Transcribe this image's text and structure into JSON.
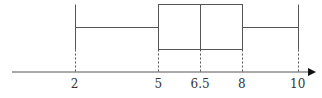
{
  "chart_data": {
    "type": "boxplot",
    "title": "",
    "xlabel": "",
    "ylabel": "",
    "min": 2,
    "q1": 5,
    "median": 6.5,
    "q3": 8,
    "max": 10,
    "tick_labels": [
      "2",
      "5",
      "6.5",
      "8",
      "10"
    ],
    "tick_values": [
      2,
      5,
      6.5,
      8,
      10
    ],
    "orientation": "horizontal",
    "grid": false,
    "axis_arrow": true
  },
  "style": {
    "line_color": "#555555",
    "text_color": "#333333"
  },
  "layout": {
    "axis_y": 72,
    "axis_x_start": 12,
    "axis_x_end": 316,
    "box_top": 4,
    "box_bottom": 49,
    "whisker_y": 27,
    "label_y": 88,
    "px_per_unit": 27.9,
    "x_origin_value": 2,
    "x_origin_px": 74.5
  }
}
